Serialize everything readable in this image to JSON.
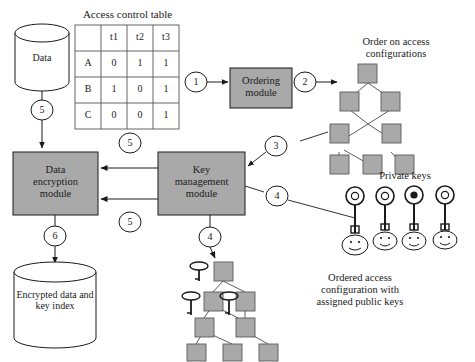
{
  "diagram": {
    "title_access_table": "Access control table",
    "access_table": {
      "col_headers": [
        "",
        "t1",
        "t2",
        "t3"
      ],
      "rows": [
        {
          "label": "A",
          "values": [
            "0",
            "1",
            "1"
          ]
        },
        {
          "label": "B",
          "values": [
            "1",
            "0",
            "1"
          ]
        },
        {
          "label": "C",
          "values": [
            "0",
            "0",
            "1"
          ]
        }
      ]
    },
    "stores": {
      "data": "Data",
      "encrypted": "Encrypted data and key index"
    },
    "modules": {
      "ordering": "Ordering module",
      "ordering_line1": "Ordering",
      "ordering_line2": "module",
      "data_encryption": "Data encryption module",
      "data_encryption_line1": "Data",
      "data_encryption_line2": "encryption",
      "data_encryption_line3": "module",
      "key_management": "Key management module",
      "key_management_line1": "Key",
      "key_management_line2": "management",
      "key_management_line3": "module"
    },
    "captions": {
      "order_on_access": "Order on access configurations",
      "order_on_access_line1": "Order on access",
      "order_on_access_line2": "configurations",
      "private_keys": "Private keys",
      "ordered_config": "Ordered access configuration with assigned public keys",
      "ordered_config_line1": "Ordered access",
      "ordered_config_line2": "configuration with",
      "ordered_config_line3": "assigned public keys"
    },
    "step_numbers": {
      "s1": "1",
      "s2": "2",
      "s3": "3",
      "s4_keys": "4",
      "s4_tree": "4",
      "s5_data": "5",
      "s5_top": "5",
      "s5_bottom": "5",
      "s6": "6"
    },
    "colors": {
      "module_fill": "#a9a9a9",
      "node_fill": "#a9a9a9",
      "stroke": "#1a1a1a",
      "background": "#ffffff"
    },
    "private_key_count": 4,
    "face_count": 4,
    "top_tree_nodes": 8,
    "bottom_tree_nodes": 8
  }
}
